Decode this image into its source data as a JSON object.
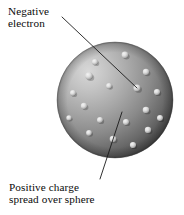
{
  "figure": {
    "background_color": "#ffffff",
    "width": 184,
    "height": 215
  },
  "labels": {
    "electron": {
      "name": "negative-electron-label",
      "line1": "Negative",
      "line2": "electron",
      "x": 8,
      "y": 5
    },
    "charge": {
      "name": "positive-charge-label",
      "line1": "Positive charge",
      "line2": "spread over sphere",
      "x": 9,
      "y": 181
    }
  },
  "leader_lines": [
    {
      "name": "electron-leader-line",
      "from": [
        62,
        17
      ],
      "to": [
        137,
        88
      ],
      "color": "#1a1a1a",
      "width": 0.9
    },
    {
      "name": "charge-leader-line",
      "from": [
        122,
        112
      ],
      "to": [
        100,
        179
      ],
      "color": "#1a1a1a",
      "width": 0.9
    }
  ],
  "sphere": {
    "name": "positive-charge-sphere",
    "cx": 115,
    "cy": 100,
    "r": 58,
    "highlight_color": "#cfcfcf",
    "mid_color": "#9a9a9a",
    "shadow_color": "#454545",
    "edge_color": "#3a3a3a",
    "highlight_cx": 88,
    "highlight_cy": 72
  },
  "electrons": {
    "name": "electron-dots",
    "count": 18,
    "color": "#e8e8e8",
    "shadow_color": "#5e5e5e",
    "points": [
      {
        "cx": 95,
        "cy": 62,
        "r": 3.1
      },
      {
        "cx": 125,
        "cy": 55,
        "r": 3.4
      },
      {
        "cx": 146,
        "cy": 72,
        "r": 3.2
      },
      {
        "cx": 89,
        "cy": 76,
        "r": 3.8
      },
      {
        "cx": 109,
        "cy": 86,
        "r": 2.9
      },
      {
        "cx": 73,
        "cy": 93,
        "r": 3.0
      },
      {
        "cx": 137,
        "cy": 88,
        "r": 3.6
      },
      {
        "cx": 157,
        "cy": 92,
        "r": 3.1
      },
      {
        "cx": 84,
        "cy": 106,
        "r": 3.2
      },
      {
        "cx": 146,
        "cy": 110,
        "r": 3.3
      },
      {
        "cx": 160,
        "cy": 118,
        "r": 3.0
      },
      {
        "cx": 100,
        "cy": 120,
        "r": 3.0
      },
      {
        "cx": 126,
        "cy": 122,
        "r": 3.1
      },
      {
        "cx": 148,
        "cy": 130,
        "r": 3.2
      },
      {
        "cx": 89,
        "cy": 133,
        "r": 2.9
      },
      {
        "cx": 113,
        "cy": 139,
        "r": 3.3
      },
      {
        "cx": 133,
        "cy": 145,
        "r": 3.1
      },
      {
        "cx": 69,
        "cy": 118,
        "r": 2.7
      }
    ]
  }
}
